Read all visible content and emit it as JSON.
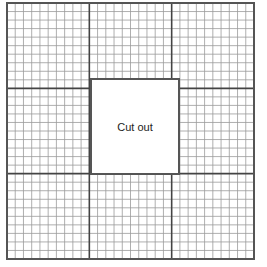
{
  "diagram": {
    "type": "grid-paper-with-cutout",
    "grid": {
      "left": 7,
      "top": 3,
      "right": 254,
      "bottom": 259,
      "major_divisions": 3,
      "minor_per_major": 10,
      "minor_color": "#9a9a9a",
      "major_color": "#444444",
      "border_color": "#555555"
    },
    "cutout": {
      "label": "Cut out",
      "left": 90,
      "top": 78,
      "width": 90,
      "height": 97
    }
  }
}
